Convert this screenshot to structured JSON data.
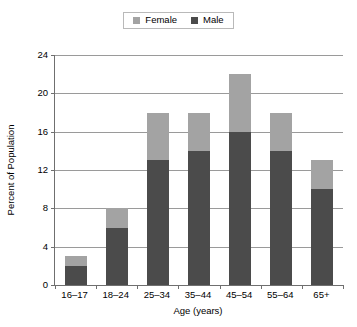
{
  "legend": {
    "entries": [
      {
        "label": "Female",
        "color": "#a3a3a3",
        "swatch_name": "legend-swatch-female"
      },
      {
        "label": "Male",
        "color": "#4b4b4b",
        "swatch_name": "legend-swatch-male"
      }
    ]
  },
  "axes": {
    "y_title": "Percent of Population",
    "x_title": "Age (years)",
    "y_ticks": [
      "0",
      "4",
      "8",
      "12",
      "16",
      "20",
      "24"
    ]
  },
  "chart_data": {
    "type": "bar",
    "title": "",
    "subtitle": "",
    "stacked": true,
    "categories": [
      "16–17",
      "18–24",
      "25–34",
      "35–44",
      "45–54",
      "55–64",
      "65+"
    ],
    "series": [
      {
        "name": "Male",
        "color": "#4b4b4b",
        "values": [
          2,
          6,
          13,
          14,
          16,
          14,
          10
        ]
      },
      {
        "name": "Female",
        "color": "#a3a3a3",
        "values": [
          1,
          2,
          5,
          4,
          6,
          4,
          3
        ]
      }
    ],
    "totals": [
      3,
      8,
      18,
      18,
      22,
      18,
      13
    ],
    "xlabel": "Age (years)",
    "ylabel": "Percent of Population",
    "ylim": [
      0,
      24
    ],
    "ytick_values": [
      0,
      4,
      8,
      12,
      16,
      20,
      24
    ],
    "grid": true,
    "legend_position": "top-center"
  }
}
